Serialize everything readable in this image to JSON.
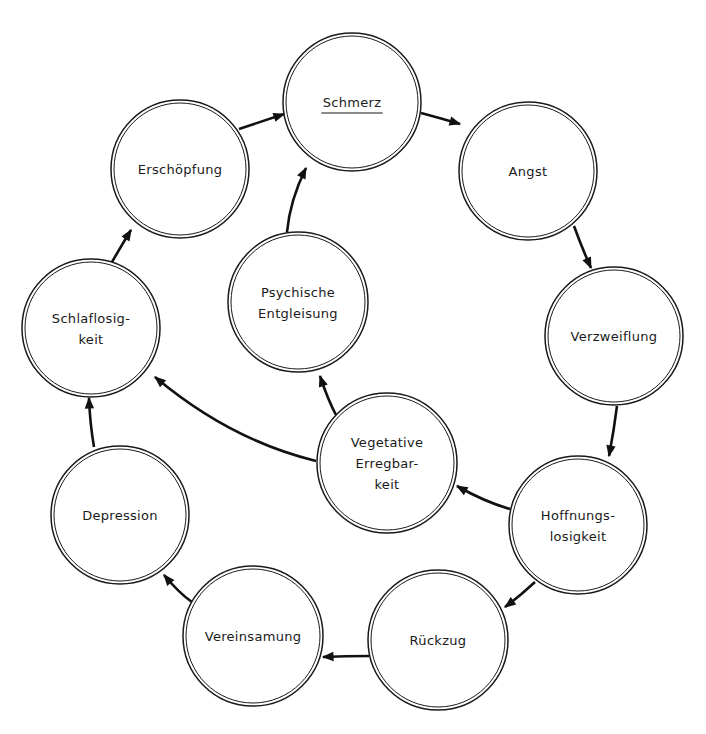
{
  "diagram": {
    "type": "cycle-diagram",
    "colors": {
      "stroke": "#1a1a1a",
      "background": "#ffffff"
    },
    "nodes": [
      {
        "id": "schmerz",
        "lines": [
          "Schmerz"
        ],
        "underlined": true,
        "cx": 352,
        "cy": 102,
        "r": 69
      },
      {
        "id": "angst",
        "lines": [
          "Angst"
        ],
        "cx": 528,
        "cy": 171,
        "r": 69
      },
      {
        "id": "verzweiflung",
        "lines": [
          "Verzweiflung"
        ],
        "cx": 614,
        "cy": 336,
        "r": 69
      },
      {
        "id": "hoffnungslosigkeit",
        "lines": [
          "Hoffnungs-",
          "losigkeit"
        ],
        "cx": 578,
        "cy": 525,
        "r": 69
      },
      {
        "id": "rueckzug",
        "lines": [
          "Rückzug"
        ],
        "cx": 438,
        "cy": 640,
        "r": 70
      },
      {
        "id": "vereinsamung",
        "lines": [
          "Vereinsamung"
        ],
        "cx": 253,
        "cy": 636,
        "r": 70
      },
      {
        "id": "depression",
        "lines": [
          "Depression"
        ],
        "cx": 120,
        "cy": 515,
        "r": 69
      },
      {
        "id": "schlaflosigkeit",
        "lines": [
          "Schlaflosig-",
          "keit"
        ],
        "cx": 91,
        "cy": 328,
        "r": 69
      },
      {
        "id": "erschoepfung",
        "lines": [
          "Erschöpfung"
        ],
        "cx": 180,
        "cy": 169,
        "r": 69
      },
      {
        "id": "psychische",
        "lines": [
          "Psychische",
          "Entgleisung"
        ],
        "cx": 298,
        "cy": 302,
        "r": 70
      },
      {
        "id": "vegetative",
        "lines": [
          "Vegetative",
          "Erregbar-",
          "keit"
        ],
        "cx": 387,
        "cy": 463,
        "r": 70
      }
    ],
    "edges": [
      {
        "from": "schmerz",
        "to": "angst",
        "path": "M421,113 Q440,118 460,124"
      },
      {
        "from": "angst",
        "to": "verzweiflung",
        "path": "M574,226 Q582,248 591,268"
      },
      {
        "from": "verzweiflung",
        "to": "hoffnungslosigkeit",
        "path": "M617,406 Q614,430 609,456"
      },
      {
        "from": "hoffnungslosigkeit",
        "to": "rueckzug",
        "path": "M535,582 Q520,596 505,607"
      },
      {
        "from": "rueckzug",
        "to": "vereinsamung",
        "path": "M369,656 Q345,656 323,657"
      },
      {
        "from": "vereinsamung",
        "to": "depression",
        "path": "M192,602 Q180,594 164,575"
      },
      {
        "from": "depression",
        "to": "schlaflosigkeit",
        "path": "M94,447 Q90,424 89,398"
      },
      {
        "from": "schlaflosigkeit",
        "to": "erschoepfung",
        "path": "M112,262 Q120,248 131,230"
      },
      {
        "from": "erschoepfung",
        "to": "schmerz",
        "path": "M239,129 Q260,122 284,114"
      },
      {
        "from": "hoffnungslosigkeit",
        "to": "vegetative",
        "path": "M510,509 Q485,502 457,486"
      },
      {
        "from": "vegetative",
        "to": "psychische",
        "path": "M336,415 Q328,400 320,376"
      },
      {
        "from": "vegetative",
        "to": "schlaflosigkeit",
        "path": "M316,461 Q230,440 155,377"
      },
      {
        "from": "psychische",
        "to": "schmerz",
        "path": "M287,232 Q290,200 306,168"
      }
    ]
  }
}
